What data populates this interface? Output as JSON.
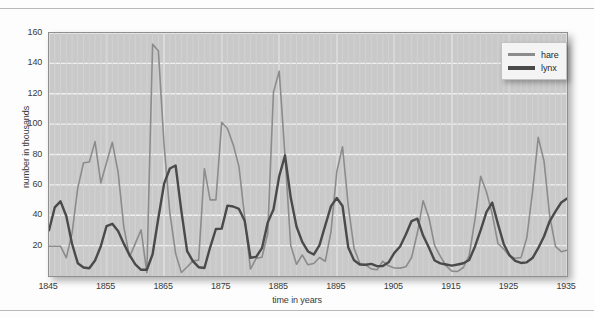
{
  "chart_data": {
    "type": "line",
    "title": "",
    "xlabel": "time in years",
    "ylabel": "number in thousands",
    "xlim": [
      1845,
      1935
    ],
    "ylim": [
      0,
      160
    ],
    "xticks": [
      1845,
      1855,
      1865,
      1875,
      1885,
      1895,
      1905,
      1915,
      1925,
      1935
    ],
    "yticks": [
      20,
      40,
      60,
      80,
      100,
      120,
      140,
      160
    ],
    "grid": true,
    "legend_position": "upper-right",
    "x": [
      1845,
      1846,
      1847,
      1848,
      1849,
      1850,
      1851,
      1852,
      1853,
      1854,
      1855,
      1856,
      1857,
      1858,
      1859,
      1860,
      1861,
      1862,
      1863,
      1864,
      1865,
      1866,
      1867,
      1868,
      1869,
      1870,
      1871,
      1872,
      1873,
      1874,
      1875,
      1876,
      1877,
      1878,
      1879,
      1880,
      1881,
      1882,
      1883,
      1884,
      1885,
      1886,
      1887,
      1888,
      1889,
      1890,
      1891,
      1892,
      1893,
      1894,
      1895,
      1896,
      1897,
      1898,
      1899,
      1900,
      1901,
      1902,
      1903,
      1904,
      1905,
      1906,
      1907,
      1908,
      1909,
      1910,
      1911,
      1912,
      1913,
      1914,
      1915,
      1916,
      1917,
      1918,
      1919,
      1920,
      1921,
      1922,
      1923,
      1924,
      1925,
      1926,
      1927,
      1928,
      1929,
      1930,
      1931,
      1932,
      1933,
      1934,
      1935
    ],
    "series": [
      {
        "name": "hare",
        "color": "#8c8c8c",
        "values": [
          19.58,
          19.6,
          19.61,
          11.99,
          28.04,
          58.0,
          74.6,
          75.09,
          88.48,
          61.28,
          74.67,
          88.06,
          68.51,
          32.19,
          12.64,
          21.49,
          30.35,
          2.18,
          152.65,
          148.36,
          85.81,
          41.41,
          14.75,
          2.28,
          5.91,
          9.95,
          10.44,
          70.64,
          50.12,
          50.13,
          101.25,
          97.12,
          86.51,
          72.17,
          38.77,
          4.57,
          11.61,
          12.38,
          27.78,
          121.08,
          134.86,
          79.4,
          20.16,
          7.73,
          13.82,
          7.37,
          8.2,
          12.2,
          9.72,
          29.3,
          68.7,
          85.1,
          46.1,
          18.2,
          8.4,
          7.4,
          4.7,
          4.1,
          9.7,
          6.7,
          5.3,
          5.2,
          6.1,
          12.2,
          28.3,
          49.5,
          38.5,
          20.2,
          12.9,
          6.6,
          3.2,
          3.0,
          5.6,
          13.5,
          36.8,
          65.6,
          55.5,
          41.0,
          21.4,
          17.8,
          13.2,
          11.7,
          12.1,
          24.8,
          55.0,
          91.3,
          75.8,
          39.5,
          19.5,
          16.0,
          17.0
        ]
      },
      {
        "name": "lynx",
        "color": "#4a4a4a",
        "values": [
          30.09,
          45.15,
          49.15,
          39.52,
          21.23,
          8.42,
          5.56,
          5.08,
          10.17,
          19.6,
          32.91,
          34.38,
          29.59,
          21.3,
          13.69,
          7.65,
          4.08,
          4.09,
          14.33,
          38.22,
          60.78,
          70.77,
          72.77,
          42.68,
          16.39,
          9.83,
          5.8,
          5.26,
          18.91,
          30.95,
          31.18,
          46.34,
          45.77,
          44.15,
          36.33,
          12.03,
          12.6,
          18.34,
          35.14,
          43.77,
          65.69,
          79.35,
          51.65,
          32.59,
          22.45,
          16.16,
          14.12,
          20.38,
          33.33,
          46.0,
          51.4,
          46.1,
          18.7,
          10.4,
          7.6,
          7.4,
          8.0,
          6.5,
          6.6,
          9.0,
          15.2,
          19.4,
          27.3,
          36.2,
          37.7,
          26.6,
          18.7,
          10.2,
          8.3,
          7.6,
          6.8,
          7.6,
          8.4,
          10.5,
          19.3,
          30.2,
          42.1,
          48.3,
          34.3,
          21.1,
          13.7,
          10.0,
          8.6,
          9.0,
          11.8,
          18.3,
          26.0,
          36.2,
          42.6,
          48.4,
          51.0
        ]
      }
    ]
  },
  "legend": {
    "items": [
      {
        "label": "hare",
        "color": "#8c8c8c",
        "thickness": 3
      },
      {
        "label": "lynx",
        "color": "#4a4a4a",
        "thickness": 4
      }
    ]
  },
  "axes": {
    "x_title": "time in years",
    "y_title": "number in thousands",
    "x_ticks": [
      "1845",
      "1855",
      "1865",
      "1875",
      "1885",
      "1895",
      "1905",
      "1915",
      "1925",
      "1935"
    ],
    "y_ticks": [
      "160",
      "140",
      "120",
      "100",
      "80",
      "60",
      "40",
      "20"
    ]
  },
  "colors": {
    "plot_background": "#c9c9c9",
    "gridline": "#f0f0f0",
    "plot_border": "#8f8f8f",
    "text": "#3a3a3a",
    "hare": "#8c8c8c",
    "lynx": "#4a4a4a"
  }
}
